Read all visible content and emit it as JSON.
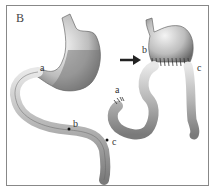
{
  "figure": {
    "panel_label": "B",
    "left_labels": {
      "a": "a",
      "b": "b",
      "c": "c"
    },
    "right_labels": {
      "a": "a",
      "b": "b",
      "c": "c"
    },
    "arrow": "right-arrow"
  }
}
